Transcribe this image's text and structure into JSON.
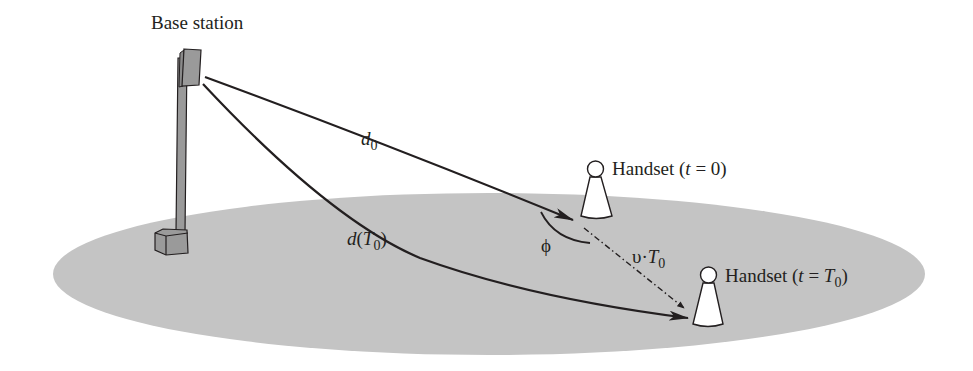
{
  "diagram": {
    "base_station": {
      "label": "Base station"
    },
    "handsets": [
      {
        "label_prefix": "Handset (",
        "var": "t",
        "eq": " = ",
        "value": "0",
        "value_sub": "",
        "label_suffix": ")"
      },
      {
        "label_prefix": "Handset (",
        "var": "t",
        "eq": " = ",
        "value": "T",
        "value_sub": "0",
        "label_suffix": ")"
      }
    ],
    "paths": {
      "d0": {
        "symbol": "d",
        "sub": "0"
      },
      "dT0": {
        "symbol": "d",
        "open": "(",
        "inner": "T",
        "inner_sub": "0",
        "close": ")"
      }
    },
    "angle": {
      "symbol": "ϕ"
    },
    "displacement": {
      "symbol": "υ",
      "dot": "·",
      "var": "T",
      "sub": "0"
    },
    "colors": {
      "ground": "#c4c4c4",
      "equipment": "#9a9a9a",
      "ink": "#231f20",
      "handset_fill": "#ffffff"
    }
  }
}
